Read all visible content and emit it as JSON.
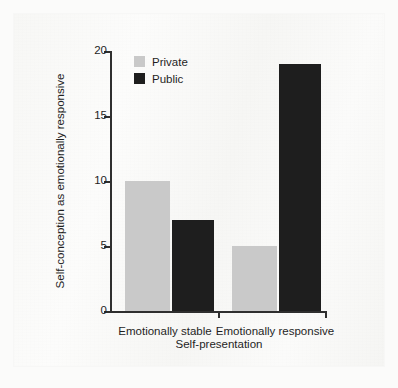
{
  "chart_data": {
    "type": "bar",
    "title": "",
    "subtitle": "",
    "xlabel": "Self-presentation",
    "ylabel": "Self-conception as emotionally responsive",
    "categories": [
      "Emotionally stable",
      "Emotionally responsive"
    ],
    "series": [
      {
        "name": "Private",
        "values": [
          10,
          5
        ],
        "color": "#c9c9c9"
      },
      {
        "name": "Public",
        "values": [
          7,
          19
        ],
        "color": "#1e1e1e"
      }
    ],
    "ylim": [
      0,
      20
    ],
    "ytick_labels": [
      "0",
      "5",
      "10",
      "15",
      "20"
    ],
    "ytick_values": [
      0,
      5,
      10,
      15,
      20
    ],
    "grid": false,
    "legend_position": "top-left-inside",
    "annotations": []
  },
  "legend": {
    "items": [
      {
        "label": "Private",
        "color": "#c9c9c9"
      },
      {
        "label": "Public",
        "color": "#1e1e1e"
      }
    ]
  },
  "colors": {
    "private": "#c9c9c9",
    "public": "#1e1e1e",
    "axis": "#2f2f2f",
    "text": "#1f1f1f",
    "page": "#f8f8f6"
  }
}
